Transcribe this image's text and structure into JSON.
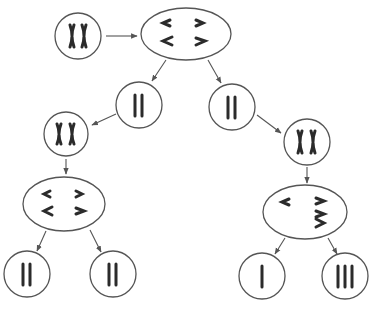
{
  "diagram": {
    "colors": {
      "outline": "#555555",
      "chromosome": "#2b2b2b",
      "background": "#ffffff"
    },
    "nodes": [
      {
        "id": "parent",
        "shape": "circle",
        "content": "XX",
        "label": "Parent cell with duplicated pair (XX)"
      },
      {
        "id": "metaphase1",
        "shape": "ellipse",
        "content": "< > / < >",
        "label": "Meiosis I: homologues aligned"
      },
      {
        "id": "daughter-left",
        "shape": "circle",
        "content": "II",
        "label": "Daughter cell (2 chromatids)"
      },
      {
        "id": "daughter-right",
        "shape": "circle",
        "content": "II",
        "label": "Daughter cell (2 chromatids)"
      },
      {
        "id": "left-xx",
        "shape": "circle",
        "content": "XX",
        "label": "Left cell condensed (XX)"
      },
      {
        "id": "right-xx",
        "shape": "circle",
        "content": "XX",
        "label": "Right cell condensed (XX)"
      },
      {
        "id": "left-metaphase2",
        "shape": "ellipse",
        "content": "< > / < >",
        "label": "Meiosis II normal separation"
      },
      {
        "id": "right-metaphase2",
        "shape": "ellipse",
        "content": "< / > > >",
        "label": "Meiosis II nondisjunction"
      },
      {
        "id": "gamete-1",
        "shape": "circle",
        "content": "II",
        "label": "Gamete (2)"
      },
      {
        "id": "gamete-2",
        "shape": "circle",
        "content": "II",
        "label": "Gamete (2)"
      },
      {
        "id": "gamete-3",
        "shape": "circle",
        "content": "I",
        "label": "Gamete (1)"
      },
      {
        "id": "gamete-4",
        "shape": "circle",
        "content": "III",
        "label": "Gamete (3)"
      }
    ],
    "edges": [
      {
        "from": "parent",
        "to": "metaphase1"
      },
      {
        "from": "metaphase1",
        "to": "daughter-left"
      },
      {
        "from": "metaphase1",
        "to": "daughter-right"
      },
      {
        "from": "daughter-left",
        "to": "left-xx"
      },
      {
        "from": "daughter-right",
        "to": "right-xx"
      },
      {
        "from": "left-xx",
        "to": "left-metaphase2"
      },
      {
        "from": "right-xx",
        "to": "right-metaphase2"
      },
      {
        "from": "left-metaphase2",
        "to": "gamete-1"
      },
      {
        "from": "left-metaphase2",
        "to": "gamete-2"
      },
      {
        "from": "right-metaphase2",
        "to": "gamete-3"
      },
      {
        "from": "right-metaphase2",
        "to": "gamete-4"
      }
    ]
  }
}
